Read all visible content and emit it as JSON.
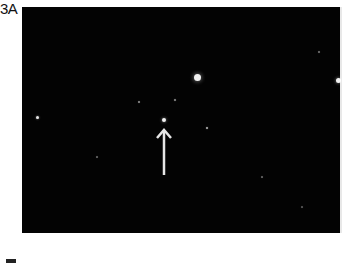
{
  "figure": {
    "panel_label": "3A",
    "background_color": "#030303",
    "stars": [
      {
        "x": 175,
        "y": 70,
        "r": 3.5,
        "opacity": 0.95
      },
      {
        "x": 142,
        "y": 113,
        "r": 2.2,
        "opacity": 0.95
      },
      {
        "x": 15,
        "y": 110,
        "r": 1.5,
        "opacity": 0.9
      },
      {
        "x": 316,
        "y": 73,
        "r": 2.5,
        "opacity": 0.95
      },
      {
        "x": 185,
        "y": 121,
        "r": 1,
        "opacity": 0.7
      },
      {
        "x": 153,
        "y": 93,
        "r": 0.8,
        "opacity": 0.5
      },
      {
        "x": 117,
        "y": 95,
        "r": 0.7,
        "opacity": 0.5
      },
      {
        "x": 297,
        "y": 45,
        "r": 0.7,
        "opacity": 0.4
      },
      {
        "x": 75,
        "y": 150,
        "r": 0.6,
        "opacity": 0.35
      },
      {
        "x": 240,
        "y": 170,
        "r": 0.6,
        "opacity": 0.35
      },
      {
        "x": 280,
        "y": 200,
        "r": 0.6,
        "opacity": 0.3
      }
    ],
    "arrow": {
      "x": 142,
      "y_tip": 123,
      "y_tail": 168,
      "color": "#e6e6e6",
      "direction": "up"
    }
  }
}
